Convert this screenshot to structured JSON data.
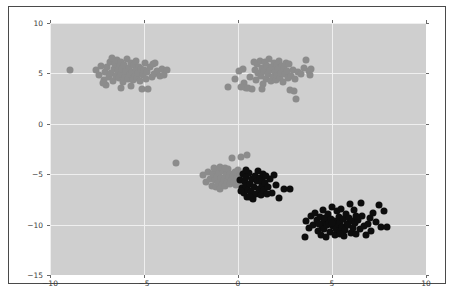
{
  "figure": {
    "caption": "",
    "background_color": "#ffffff",
    "frame_color": "#4a4a4a"
  },
  "chart_data": {
    "type": "scatter",
    "title": "",
    "xlabel": "",
    "ylabel": "",
    "xlim": [
      -10,
      10
    ],
    "ylim": [
      -15,
      10
    ],
    "xticks": [
      -10,
      -5,
      0,
      5,
      10
    ],
    "yticks": [
      -15,
      -10,
      -5,
      0,
      5,
      10
    ],
    "xtick_labels": [
      "-10",
      "-5",
      "0",
      "5",
      "10"
    ],
    "ytick_labels": [
      "-15",
      "-10",
      "-5",
      "0",
      "5",
      "10"
    ],
    "grid": true,
    "grid_color": "#efefef",
    "plot_background": "#cfcfcf",
    "legend": null,
    "marker_size_px": 7,
    "series": [
      {
        "name": "cluster-gray",
        "color": "#8c8c8c",
        "points": [
          [
            -8.95,
            5.3
          ],
          [
            -7.55,
            5.35
          ],
          [
            -7.4,
            4.85
          ],
          [
            -7.3,
            5.75
          ],
          [
            -7.15,
            4.35
          ],
          [
            -7.05,
            5.15
          ],
          [
            -7.0,
            3.85
          ],
          [
            -6.95,
            5.6
          ],
          [
            -6.85,
            4.6
          ],
          [
            -6.8,
            6.1
          ],
          [
            -6.75,
            5.0
          ],
          [
            -6.65,
            4.25
          ],
          [
            -6.6,
            5.45
          ],
          [
            -6.55,
            5.95
          ],
          [
            -6.5,
            4.75
          ],
          [
            -6.45,
            6.35
          ],
          [
            -6.4,
            5.2
          ],
          [
            -6.35,
            4.5
          ],
          [
            -6.3,
            5.7
          ],
          [
            -6.25,
            4.95
          ],
          [
            -6.2,
            6.15
          ],
          [
            -6.15,
            5.4
          ],
          [
            -6.1,
            4.15
          ],
          [
            -6.05,
            5.85
          ],
          [
            -6.0,
            4.65
          ],
          [
            -5.95,
            5.25
          ],
          [
            -5.9,
            6.45
          ],
          [
            -5.85,
            4.4
          ],
          [
            -5.8,
            5.55
          ],
          [
            -5.75,
            4.9
          ],
          [
            -5.7,
            6.0
          ],
          [
            -5.65,
            5.1
          ],
          [
            -5.6,
            4.3
          ],
          [
            -5.55,
            5.8
          ],
          [
            -5.5,
            4.7
          ],
          [
            -5.45,
            5.35
          ],
          [
            -5.4,
            6.2
          ],
          [
            -5.35,
            4.55
          ],
          [
            -5.3,
            5.0
          ],
          [
            -5.25,
            5.65
          ],
          [
            -5.2,
            4.2
          ],
          [
            -5.15,
            5.45
          ],
          [
            -5.1,
            3.5
          ],
          [
            -5.05,
            4.85
          ],
          [
            -5.0,
            5.3
          ],
          [
            -4.95,
            6.05
          ],
          [
            -4.9,
            4.45
          ],
          [
            -4.85,
            5.15
          ],
          [
            -4.8,
            3.45
          ],
          [
            -4.7,
            5.6
          ],
          [
            -4.6,
            4.6
          ],
          [
            -4.5,
            5.9
          ],
          [
            -4.45,
            4.95
          ],
          [
            -4.3,
            5.2
          ],
          [
            -4.15,
            4.75
          ],
          [
            -4.05,
            5.45
          ],
          [
            -3.95,
            4.8
          ],
          [
            -3.8,
            5.3
          ],
          [
            -6.7,
            6.5
          ],
          [
            -6.2,
            3.6
          ],
          [
            -5.7,
            3.75
          ],
          [
            -7.2,
            4.0
          ],
          [
            -4.4,
            6.05
          ]
        ]
      },
      {
        "name": "cluster-gray-2",
        "color": "#8c8c8c",
        "points": [
          [
            -0.15,
            4.45
          ],
          [
            0.05,
            5.25
          ],
          [
            0.25,
            5.45
          ],
          [
            0.3,
            4.05
          ],
          [
            0.55,
            3.55
          ],
          [
            0.65,
            4.6
          ],
          [
            0.75,
            3.45
          ],
          [
            0.9,
            5.35
          ],
          [
            0.95,
            4.3
          ],
          [
            1.0,
            5.95
          ],
          [
            1.05,
            5.0
          ],
          [
            1.15,
            6.25
          ],
          [
            1.2,
            4.7
          ],
          [
            1.3,
            5.55
          ],
          [
            1.35,
            3.9
          ],
          [
            1.4,
            5.2
          ],
          [
            1.45,
            6.1
          ],
          [
            1.5,
            4.45
          ],
          [
            1.55,
            5.75
          ],
          [
            1.6,
            4.95
          ],
          [
            1.65,
            6.4
          ],
          [
            1.7,
            5.3
          ],
          [
            1.75,
            4.2
          ],
          [
            1.8,
            5.6
          ],
          [
            1.85,
            4.65
          ],
          [
            1.9,
            6.0
          ],
          [
            1.95,
            5.1
          ],
          [
            2.0,
            4.35
          ],
          [
            2.05,
            5.85
          ],
          [
            2.1,
            4.8
          ],
          [
            2.15,
            5.4
          ],
          [
            2.2,
            6.2
          ],
          [
            2.25,
            4.5
          ],
          [
            2.3,
            5.05
          ],
          [
            2.35,
            5.7
          ],
          [
            2.4,
            4.15
          ],
          [
            2.45,
            5.5
          ],
          [
            2.5,
            4.9
          ],
          [
            2.55,
            6.05
          ],
          [
            2.6,
            5.25
          ],
          [
            2.65,
            4.55
          ],
          [
            2.7,
            5.9
          ],
          [
            2.8,
            4.7
          ],
          [
            2.9,
            5.35
          ],
          [
            3.0,
            3.3
          ],
          [
            3.05,
            4.4
          ],
          [
            3.1,
            2.5
          ],
          [
            3.2,
            5.15
          ],
          [
            3.35,
            4.95
          ],
          [
            3.5,
            5.55
          ],
          [
            3.6,
            6.3
          ],
          [
            3.75,
            5.2
          ],
          [
            3.85,
            4.85
          ],
          [
            3.9,
            5.45
          ],
          [
            0.45,
            3.6
          ],
          [
            0.15,
            3.65
          ],
          [
            -0.55,
            3.7
          ],
          [
            2.75,
            3.35
          ],
          [
            1.25,
            3.5
          ],
          [
            0.85,
            6.1
          ]
        ]
      },
      {
        "name": "cluster-gray-3",
        "color": "#8c8c8c",
        "points": [
          [
            -3.3,
            -3.9
          ],
          [
            -1.85,
            -5.1
          ],
          [
            -1.7,
            -5.75
          ],
          [
            -1.6,
            -4.8
          ],
          [
            -1.5,
            -5.45
          ],
          [
            -1.4,
            -6.15
          ],
          [
            -1.35,
            -5.0
          ],
          [
            -1.25,
            -5.6
          ],
          [
            -1.2,
            -4.6
          ],
          [
            -1.15,
            -6.3
          ],
          [
            -1.1,
            -5.25
          ],
          [
            -1.05,
            -5.85
          ],
          [
            -1.0,
            -4.9
          ],
          [
            -0.95,
            -6.45
          ],
          [
            -0.9,
            -5.4
          ],
          [
            -0.85,
            -6.05
          ],
          [
            -0.8,
            -4.7
          ],
          [
            -0.75,
            -5.55
          ],
          [
            -0.7,
            -6.2
          ],
          [
            -0.65,
            -5.05
          ],
          [
            -0.6,
            -5.9
          ],
          [
            -0.55,
            -4.5
          ],
          [
            -0.5,
            -5.3
          ],
          [
            -0.45,
            -6.0
          ],
          [
            -0.4,
            -4.95
          ],
          [
            -0.35,
            -5.65
          ],
          [
            -0.3,
            -3.35
          ],
          [
            -0.25,
            -5.2
          ],
          [
            -0.2,
            -5.8
          ],
          [
            -0.15,
            -4.75
          ],
          [
            -0.1,
            -6.1
          ],
          [
            -0.05,
            -5.35
          ],
          [
            0.0,
            -4.6
          ],
          [
            0.05,
            -5.95
          ],
          [
            0.1,
            -5.05
          ],
          [
            0.15,
            -3.25
          ],
          [
            0.2,
            -5.5
          ],
          [
            0.3,
            -4.85
          ],
          [
            0.4,
            -5.7
          ],
          [
            0.5,
            -3.1
          ],
          [
            -1.3,
            -4.35
          ],
          [
            -0.95,
            -4.25
          ],
          [
            -0.7,
            -4.4
          ]
        ]
      },
      {
        "name": "cluster-black",
        "color": "#0d0d0d",
        "points": [
          [
            0.1,
            -5.55
          ],
          [
            0.2,
            -6.35
          ],
          [
            0.25,
            -4.95
          ],
          [
            0.3,
            -6.9
          ],
          [
            0.35,
            -5.8
          ],
          [
            0.4,
            -6.15
          ],
          [
            0.45,
            -5.25
          ],
          [
            0.5,
            -7.25
          ],
          [
            0.55,
            -6.55
          ],
          [
            0.6,
            -4.85
          ],
          [
            0.65,
            -5.95
          ],
          [
            0.7,
            -6.75
          ],
          [
            0.75,
            -5.45
          ],
          [
            0.8,
            -7.5
          ],
          [
            0.85,
            -6.25
          ],
          [
            0.9,
            -5.15
          ],
          [
            0.95,
            -6.95
          ],
          [
            1.0,
            -5.7
          ],
          [
            1.05,
            -4.7
          ],
          [
            1.1,
            -6.45
          ],
          [
            1.15,
            -5.35
          ],
          [
            1.2,
            -7.1
          ],
          [
            1.25,
            -6.05
          ],
          [
            1.3,
            -5.6
          ],
          [
            1.35,
            -4.95
          ],
          [
            1.4,
            -6.6
          ],
          [
            1.45,
            -5.9
          ],
          [
            1.5,
            -5.2
          ],
          [
            1.6,
            -6.3
          ],
          [
            1.7,
            -5.5
          ],
          [
            1.8,
            -6.85
          ],
          [
            1.9,
            -5.05
          ],
          [
            2.0,
            -6.1
          ],
          [
            2.2,
            -7.4
          ],
          [
            2.45,
            -6.45
          ],
          [
            2.75,
            -6.5
          ],
          [
            0.15,
            -6.7
          ],
          [
            0.65,
            -7.3
          ],
          [
            1.55,
            -7.0
          ],
          [
            0.45,
            -4.6
          ]
        ]
      },
      {
        "name": "cluster-black-2",
        "color": "#0d0d0d",
        "points": [
          [
            3.55,
            -11.2
          ],
          [
            3.6,
            -9.6
          ],
          [
            3.75,
            -10.3
          ],
          [
            3.9,
            -9.15
          ],
          [
            4.0,
            -10.0
          ],
          [
            4.1,
            -8.8
          ],
          [
            4.2,
            -9.55
          ],
          [
            4.25,
            -10.6
          ],
          [
            4.35,
            -9.2
          ],
          [
            4.4,
            -11.0
          ],
          [
            4.45,
            -10.1
          ],
          [
            4.5,
            -8.6
          ],
          [
            4.55,
            -9.75
          ],
          [
            4.6,
            -10.45
          ],
          [
            4.65,
            -9.35
          ],
          [
            4.7,
            -11.25
          ],
          [
            4.75,
            -10.0
          ],
          [
            4.8,
            -8.95
          ],
          [
            4.85,
            -9.85
          ],
          [
            4.9,
            -10.7
          ],
          [
            4.95,
            -9.4
          ],
          [
            5.0,
            -8.25
          ],
          [
            5.05,
            -10.15
          ],
          [
            5.1,
            -9.6
          ],
          [
            5.15,
            -11.05
          ],
          [
            5.2,
            -10.4
          ],
          [
            5.25,
            -8.7
          ],
          [
            5.3,
            -9.95
          ],
          [
            5.35,
            -9.25
          ],
          [
            5.4,
            -10.75
          ],
          [
            5.45,
            -9.7
          ],
          [
            5.5,
            -8.45
          ],
          [
            5.55,
            -10.2
          ],
          [
            5.6,
            -9.45
          ],
          [
            5.65,
            -11.15
          ],
          [
            5.7,
            -10.55
          ],
          [
            5.75,
            -8.9
          ],
          [
            5.8,
            -9.9
          ],
          [
            5.85,
            -10.05
          ],
          [
            5.9,
            -9.3
          ],
          [
            5.95,
            -7.95
          ],
          [
            6.0,
            -10.85
          ],
          [
            6.05,
            -9.65
          ],
          [
            6.1,
            -10.3
          ],
          [
            6.15,
            -8.55
          ],
          [
            6.2,
            -9.8
          ],
          [
            6.3,
            -10.95
          ],
          [
            6.4,
            -9.5
          ],
          [
            6.5,
            -10.45
          ],
          [
            6.55,
            -7.9
          ],
          [
            6.6,
            -9.1
          ],
          [
            6.7,
            -10.15
          ],
          [
            6.8,
            -11.0
          ],
          [
            6.9,
            -9.95
          ],
          [
            7.0,
            -9.35
          ],
          [
            7.1,
            -10.6
          ],
          [
            7.2,
            -8.8
          ],
          [
            7.35,
            -9.7
          ],
          [
            7.5,
            -8.05
          ],
          [
            7.6,
            -10.25
          ],
          [
            7.75,
            -8.65
          ],
          [
            7.9,
            -10.2
          ],
          [
            5.0,
            -9.85
          ],
          [
            5.45,
            -10.9
          ],
          [
            4.3,
            -9.9
          ],
          [
            6.25,
            -9.15
          ]
        ]
      }
    ]
  }
}
